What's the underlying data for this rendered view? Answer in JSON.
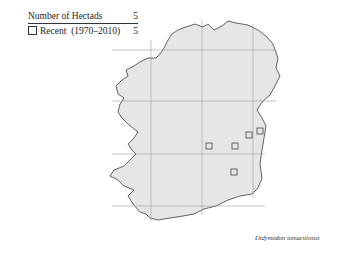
{
  "legend": {
    "header_label": "Number of Hectads",
    "header_count": "5",
    "items": [
      {
        "symbol": "open-square",
        "label": "Recent  (1970–2010)",
        "count": "5"
      }
    ]
  },
  "species_name": "Didymodon tomaculosus",
  "map": {
    "region": "Ireland",
    "land_color": "#e6e6e6",
    "coast_color": "#222222",
    "grid_color": "#a0a0a0",
    "grid_x": [
      151,
      202,
      253
    ],
    "grid_y": [
      50,
      101,
      154,
      206
    ],
    "markers": [
      {
        "x": 209,
        "y": 146,
        "symbol": "open-square"
      },
      {
        "x": 235,
        "y": 146,
        "symbol": "open-square"
      },
      {
        "x": 249,
        "y": 135,
        "symbol": "open-square"
      },
      {
        "x": 260,
        "y": 131,
        "symbol": "open-square"
      },
      {
        "x": 234,
        "y": 172,
        "symbol": "open-square"
      }
    ]
  }
}
